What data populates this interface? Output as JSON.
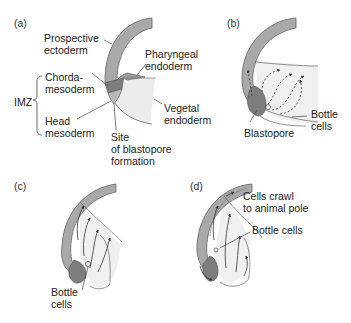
{
  "figure": {
    "panels": [
      {
        "id": "a",
        "tag": "(a)",
        "labels": {
          "prospective_ectoderm_1": "Prospective",
          "prospective_ectoderm_2": "ectoderm",
          "pharyngeal_endoderm_1": "Pharyngeal",
          "pharyngeal_endoderm_2": "endoderm",
          "chordamesoderm_1": "Chorda-",
          "chordamesoderm_2": "mesoderm",
          "imz": "IMZ",
          "head_mesoderm_1": "Head",
          "head_mesoderm_2": "mesoderm",
          "vegetal_endoderm_1": "Vegetal",
          "vegetal_endoderm_2": "endoderm",
          "blastopore_site_1": "Site",
          "blastopore_site_2": "of blastopore",
          "blastopore_site_3": "formation"
        }
      },
      {
        "id": "b",
        "tag": "(b)",
        "labels": {
          "bottle_cells_1": "Bottle",
          "bottle_cells_2": "cells",
          "blastopore": "Blastopore"
        }
      },
      {
        "id": "c",
        "tag": "(c)",
        "labels": {
          "bottle_cells_1": "Bottle",
          "bottle_cells_2": "cells"
        }
      },
      {
        "id": "d",
        "tag": "(d)",
        "labels": {
          "cells_crawl_1": "Cells crawl",
          "cells_crawl_2": "to animal pole",
          "bottle_cells": "Bottle cells"
        }
      }
    ],
    "colors": {
      "ectoderm": "#a9a9a9",
      "chordamesoderm": "#7d7d7d",
      "head_mesoderm": "#b9b9b9",
      "endoderm": "#ececec",
      "outline": "#555555",
      "text": "#222222"
    }
  }
}
